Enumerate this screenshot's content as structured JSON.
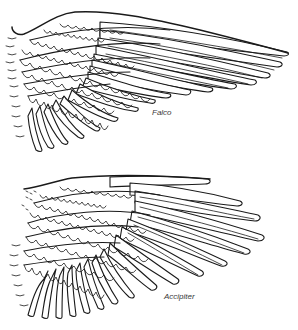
{
  "figure": {
    "colors": {
      "ink": "#1a1a1a",
      "label": "#3a3a3a",
      "background": "#ffffff"
    },
    "panels": [
      {
        "id": "falco",
        "label": "Falco",
        "label_position": {
          "x": 152,
          "y": 108
        }
      },
      {
        "id": "accipiter",
        "label": "Accipiter",
        "label_position": {
          "x": 164,
          "y": 292
        }
      }
    ]
  }
}
